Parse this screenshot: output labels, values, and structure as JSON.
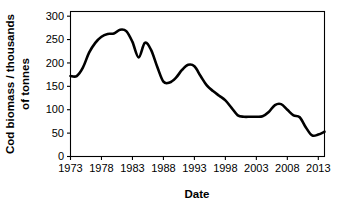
{
  "chart_data": {
    "type": "line",
    "title": "",
    "xlabel": "Date",
    "ylabel": "Cod biomass / thousands of tonnes",
    "ylabel_line1": "Cod biomass / thousands",
    "ylabel_line2": "of tonnes",
    "xlim": [
      1973,
      2014
    ],
    "ylim": [
      0,
      310
    ],
    "xticks": [
      1973,
      1978,
      1983,
      1988,
      1993,
      1998,
      2003,
      2008,
      2013
    ],
    "xtick_labels": [
      "1973",
      "1978",
      "1983",
      "1988",
      "1993",
      "1998",
      "2003",
      "2008",
      "2013"
    ],
    "yticks": [
      0,
      50,
      100,
      150,
      200,
      250,
      300
    ],
    "ytick_labels": [
      "0",
      "50",
      "100",
      "150",
      "200",
      "250",
      "300"
    ],
    "grid": false,
    "legend": false,
    "line_color": "#000000",
    "line_width": 2.6,
    "frame_color": "#000000",
    "background": "#ffffff",
    "series": [
      {
        "name": "Cod biomass",
        "x": [
          1973,
          1974,
          1975,
          1976,
          1977,
          1978,
          1979,
          1980,
          1981,
          1982,
          1983,
          1984,
          1985,
          1986,
          1987,
          1988,
          1989,
          1990,
          1991,
          1992,
          1993,
          1994,
          1995,
          1996,
          1997,
          1998,
          1999,
          2000,
          2001,
          2002,
          2003,
          2004,
          2005,
          2006,
          2007,
          2008,
          2009,
          2010,
          2011,
          2012,
          2013,
          2014
        ],
        "values": [
          172,
          172,
          190,
          222,
          243,
          256,
          262,
          263,
          271,
          268,
          245,
          212,
          243,
          228,
          192,
          160,
          158,
          168,
          185,
          196,
          193,
          172,
          152,
          140,
          130,
          120,
          104,
          88,
          85,
          85,
          85,
          86,
          95,
          110,
          112,
          100,
          88,
          84,
          62,
          45,
          47,
          53
        ]
      }
    ]
  }
}
